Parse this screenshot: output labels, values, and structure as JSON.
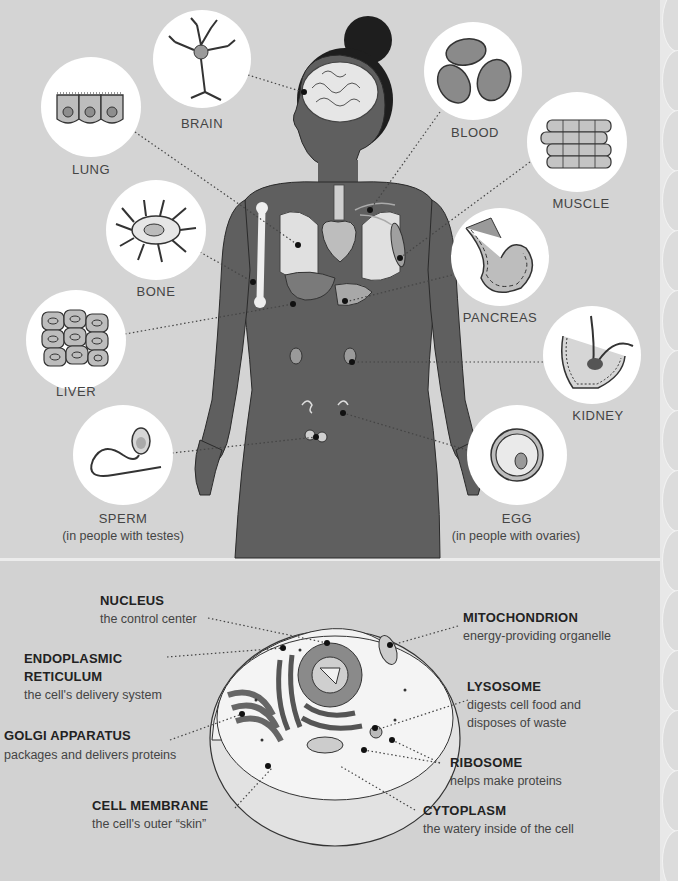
{
  "body_diagram": {
    "cells": [
      {
        "key": "brain",
        "label": "BRAIN"
      },
      {
        "key": "lung",
        "label": "LUNG"
      },
      {
        "key": "bone",
        "label": "BONE"
      },
      {
        "key": "liver",
        "label": "LIVER"
      },
      {
        "key": "sperm",
        "label": "SPERM",
        "sublabel": "(in people with testes)"
      },
      {
        "key": "blood",
        "label": "BLOOD"
      },
      {
        "key": "muscle",
        "label": "MUSCLE"
      },
      {
        "key": "pancreas",
        "label": "PANCREAS"
      },
      {
        "key": "kidney",
        "label": "KIDNEY"
      },
      {
        "key": "egg",
        "label": "EGG",
        "sublabel": "(in people with ovaries)"
      }
    ]
  },
  "cell_diagram": {
    "organelles": [
      {
        "key": "nucleus",
        "title": "NUCLEUS",
        "desc": [
          "the control center"
        ]
      },
      {
        "key": "er",
        "title": "ENDOPLASMIC",
        "title2": "RETICULUM",
        "desc": [
          "the cell's delivery system"
        ]
      },
      {
        "key": "golgi",
        "title": "GOLGI APPARATUS",
        "desc": [
          "packages and delivers proteins"
        ]
      },
      {
        "key": "membrane",
        "title": "CELL MEMBRANE",
        "desc": [
          "the cell's outer “skin”"
        ]
      },
      {
        "key": "mito",
        "title": "MITOCHONDRION",
        "desc": [
          "energy-providing organelle"
        ]
      },
      {
        "key": "lyso",
        "title": "LYSOSOME",
        "desc": [
          "digests cell food and",
          "disposes of waste"
        ]
      },
      {
        "key": "ribo",
        "title": "RIBOSOME",
        "desc": [
          "helps make proteins"
        ]
      },
      {
        "key": "cyto",
        "title": "CYTOPLASM",
        "desc": [
          "the watery inside of the cell"
        ]
      }
    ]
  },
  "colors": {
    "background": "#d4d4d4",
    "body_fill": "#5f5f5f",
    "circle_fill": "#ffffff",
    "text": "#333333"
  }
}
